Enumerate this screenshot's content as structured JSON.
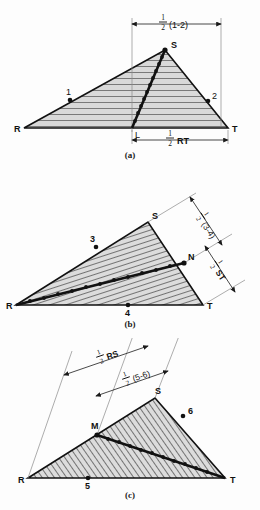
{
  "figure": {
    "panels": [
      {
        "id": "a",
        "caption": "(a)",
        "vertices": {
          "R": "R",
          "S": "S",
          "T": "T"
        },
        "points": [
          {
            "label": "1",
            "on": "RS"
          },
          {
            "label": "2",
            "on": "ST"
          },
          {
            "label": "L",
            "on": "RT"
          }
        ],
        "dimensions": [
          {
            "label_num": "1",
            "label_den": "2",
            "label_rest": "(1-2)",
            "position": "top",
            "text": "1/2 (1-2)"
          },
          {
            "label_num": "1",
            "label_den": "2",
            "label_rest": "RT",
            "position": "bottom",
            "text": "1/2 RT"
          }
        ],
        "hatch": "horizontal"
      },
      {
        "id": "b",
        "caption": "(b)",
        "vertices": {
          "R": "R",
          "S": "S",
          "T": "T"
        },
        "points": [
          {
            "label": "3",
            "on": "RS"
          },
          {
            "label": "4",
            "on": "RT"
          },
          {
            "label": "N",
            "on": "ST"
          }
        ],
        "dimensions": [
          {
            "label_num": "1",
            "label_den": "2",
            "label_rest": "(3-4)",
            "position": "right-upper",
            "text": "1/2 (3-4)"
          },
          {
            "label_num": "1",
            "label_den": "2",
            "label_rest": "ST",
            "position": "right-lower",
            "text": "1/2 ST"
          }
        ],
        "hatch": "steep"
      },
      {
        "id": "c",
        "caption": "(c)",
        "vertices": {
          "R": "R",
          "S": "S",
          "T": "T"
        },
        "points": [
          {
            "label": "5",
            "on": "RT"
          },
          {
            "label": "6",
            "on": "ST"
          },
          {
            "label": "M",
            "on": "RS"
          }
        ],
        "dimensions": [
          {
            "label_num": "1",
            "label_den": "2",
            "label_rest": "RS",
            "position": "top-outer",
            "text": "1/2 RS"
          },
          {
            "label_num": "1",
            "label_den": "2",
            "label_rest": "(5-6)",
            "position": "top-inner",
            "text": "1/2 (5-6)"
          }
        ],
        "hatch": "diagonal"
      }
    ],
    "colors": {
      "fill": "#d8d8d8",
      "stroke": "#1a1a1a",
      "hatch": "#3a3a3a",
      "thin": "#7a7a7a"
    }
  }
}
